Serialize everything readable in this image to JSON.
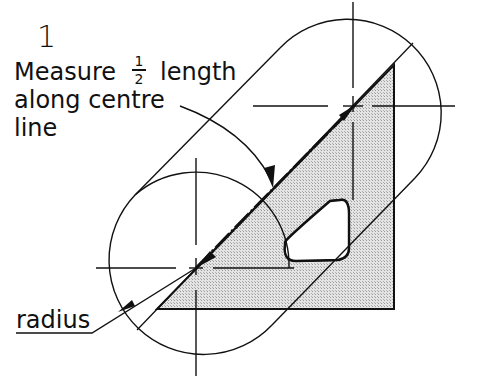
{
  "diagram": {
    "step_number": "1",
    "instruction": {
      "line1_prefix": "Measure",
      "fraction_numerator": "1",
      "fraction_denominator": "2",
      "line1_suffix": "length",
      "line2": "along centre",
      "line3": "line"
    },
    "radius_label": "radius",
    "colors": {
      "line": "#111111",
      "fill": "#d8d8d8",
      "background": "#ffffff"
    },
    "shapes": {
      "upper_circle": {
        "cx": 355,
        "cy": 105,
        "r": 92
      },
      "lower_circle": {
        "cx": 196,
        "cy": 268,
        "r": 93
      },
      "set_square_triangle": {
        "points": [
          [
            157,
            309
          ],
          [
            394,
            309
          ],
          [
            394,
            65
          ]
        ]
      },
      "cutout": "rounded triangular hole"
    }
  }
}
